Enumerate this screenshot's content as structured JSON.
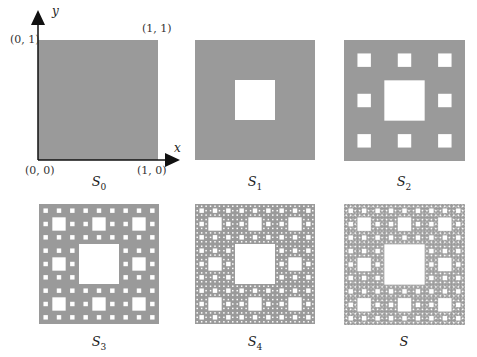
{
  "figure": {
    "panels": [
      {
        "id": "S0",
        "label_base": "S",
        "label_sub": "0",
        "level": 0,
        "x": 38,
        "y": 40,
        "size": 120
      },
      {
        "id": "S1",
        "label_base": "S",
        "label_sub": "1",
        "level": 1,
        "x": 195,
        "y": 40,
        "size": 120
      },
      {
        "id": "S2",
        "label_base": "S",
        "label_sub": "2",
        "level": 2,
        "x": 344,
        "y": 40,
        "size": 121
      },
      {
        "id": "S3",
        "label_base": "S",
        "label_sub": "3",
        "level": 3,
        "x": 39,
        "y": 204,
        "size": 120
      },
      {
        "id": "S4",
        "label_base": "S",
        "label_sub": "4",
        "level": 4,
        "x": 195,
        "y": 204,
        "size": 120
      },
      {
        "id": "S",
        "label_base": "S",
        "label_sub": "",
        "level": 5,
        "x": 344,
        "y": 204,
        "size": 121
      }
    ],
    "axes": {
      "x_label": "x",
      "y_label": "y",
      "coords": {
        "origin": "(0, 0)",
        "x_one": "(1, 0)",
        "y_one": "(0, 1)",
        "corner": "(1, 1)"
      }
    },
    "colors": {
      "fill": "#9a9a9a",
      "hole": "#ffffff",
      "axis": "#111111"
    }
  }
}
